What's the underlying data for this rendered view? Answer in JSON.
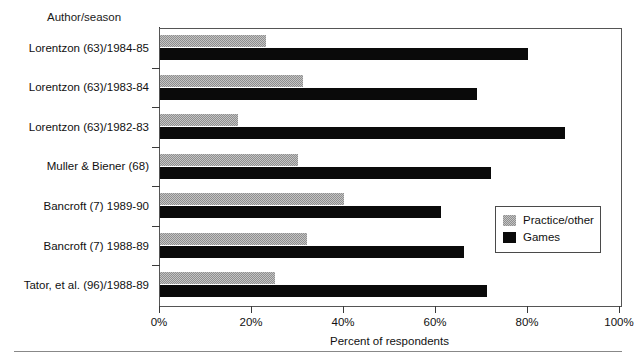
{
  "chart_data": {
    "type": "bar",
    "orientation": "horizontal",
    "title": "",
    "xlabel": "Percent of respondents",
    "ylabel": "Author/season",
    "xlim": [
      0,
      100
    ],
    "xticks": [
      "0%",
      "20%",
      "40%",
      "60%",
      "80%",
      "100%"
    ],
    "xtick_values": [
      0,
      20,
      40,
      60,
      80,
      100
    ],
    "grid": false,
    "legend_position": "middle-right-inside",
    "categories": [
      "Lorentzon (63)/1984-85",
      "Lorentzon (63)/1983-84",
      "Lorentzon (63)/1982-83",
      "Muller & Biener  (68)",
      "Bancroft (7) 1989-90",
      "Bancroft (7) 1988-89",
      "Tator, et al. (96)/1988-89"
    ],
    "series": [
      {
        "name": "Practice/other",
        "color": "#c3c3c3",
        "values": [
          23,
          31,
          17,
          30,
          40,
          32,
          25
        ]
      },
      {
        "name": "Games",
        "color": "#0a0a0a",
        "values": [
          80,
          69,
          88,
          72,
          61,
          66,
          71
        ]
      }
    ]
  },
  "axis_titles": {
    "y": "Author/season",
    "x": "Percent of respondents"
  },
  "legend": {
    "items": [
      {
        "label": "Practice/other",
        "swatch": "hatched-gray-swatch"
      },
      {
        "label": "Games",
        "swatch": "solid-black-swatch"
      }
    ]
  }
}
